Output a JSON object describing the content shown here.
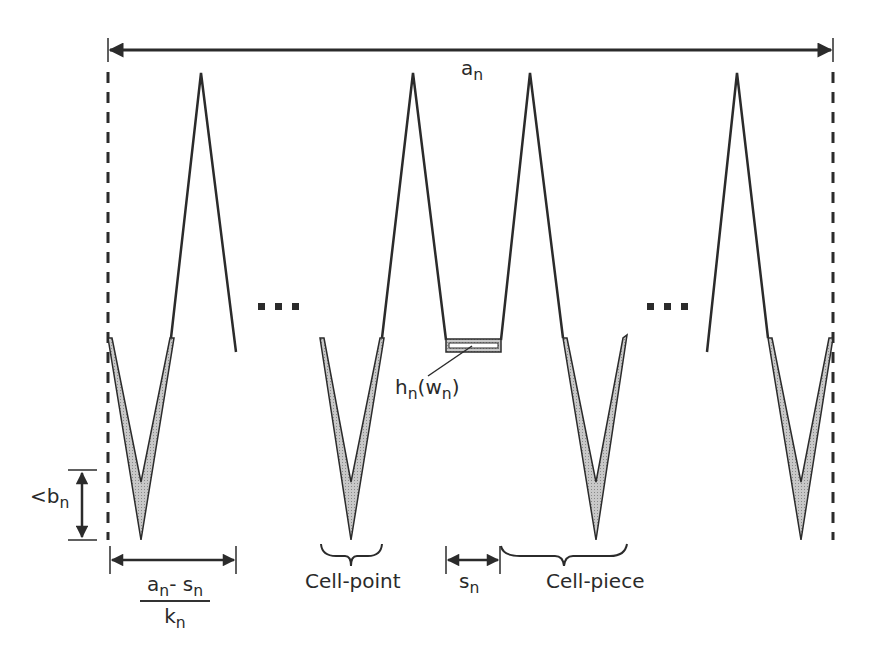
{
  "diagram": {
    "type": "cell-structure schematic",
    "colors": {
      "stroke": "#2b2b2b",
      "fill_shading": "#bdbdbd",
      "background": "#ffffff"
    },
    "labels": {
      "total_width": {
        "base": "a",
        "sub": "n"
      },
      "height_bound": {
        "prefix": "<",
        "base": "b",
        "sub": "n"
      },
      "cell_width_num": {
        "a": "a",
        "a_sub": "n",
        "op": "- ",
        "s": "s",
        "s_sub": "n"
      },
      "cell_width_den": {
        "base": "k",
        "sub": "n"
      },
      "cell_point": "Cell-point",
      "cell_piece": "Cell-piece",
      "gap": {
        "base": "s",
        "sub": "n"
      },
      "box": {
        "h": "h",
        "h_sub": "n",
        "open": "(",
        "w": "w",
        "w_sub": "n",
        "close": ")"
      }
    },
    "ellipses": [
      "■ ■ ■",
      "■ ■ ■"
    ],
    "cells": [
      {
        "name": "cell-1",
        "peak_x": 201,
        "valley_x": 141
      },
      {
        "name": "cell-2",
        "peak_x": 413,
        "valley_x": 351
      },
      {
        "name": "cell-3",
        "peak_x": 530,
        "valley_x": 596
      },
      {
        "name": "cell-4",
        "peak_x": 737,
        "valley_x": 801
      }
    ]
  }
}
